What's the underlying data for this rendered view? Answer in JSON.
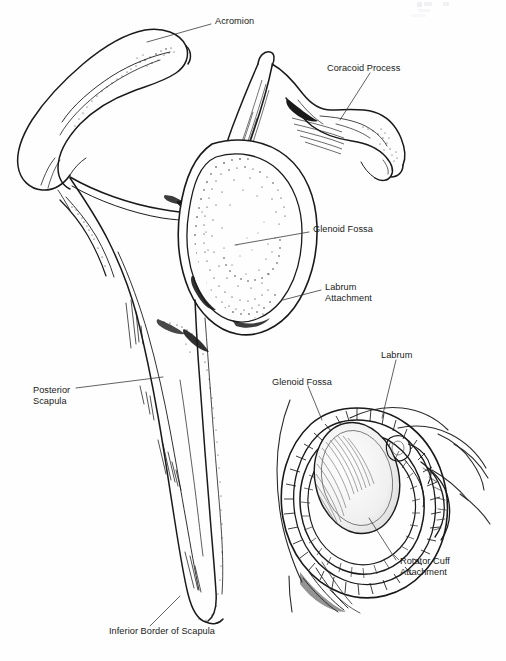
{
  "figure": {
    "type": "anatomical-line-drawing",
    "background_color": "#fefefe",
    "ink_color": "#1a1a1a",
    "text_color": "#1a1a1a",
    "width": 506,
    "height": 661
  },
  "main_view": {
    "name": "Lateral view of scapula",
    "labels": [
      {
        "key": "acromion",
        "text": "Acromion",
        "x": 215,
        "y": 21,
        "lines": 1
      },
      {
        "key": "coracoid_process",
        "text": "Coracoid Process",
        "x": 327,
        "y": 68,
        "lines": 1
      },
      {
        "key": "glenoid_fossa",
        "text": "Glenoid Fossa",
        "x": 313,
        "y": 229,
        "lines": 1
      },
      {
        "key": "labrum_attachment_line1",
        "text": "Labrum",
        "x": 325,
        "y": 287,
        "lines": 2
      },
      {
        "key": "labrum_attachment_line2",
        "text": "Attachment",
        "x": 325,
        "y": 298,
        "lines": 2
      },
      {
        "key": "posterior_scapula_line1",
        "text": "Posterior",
        "x": 33,
        "y": 390,
        "lines": 2
      },
      {
        "key": "posterior_scapula_line2",
        "text": "Scapula",
        "x": 33,
        "y": 401,
        "lines": 2
      },
      {
        "key": "inferior_border",
        "text": "Inferior Border of Scapula",
        "x": 109,
        "y": 631,
        "lines": 1
      }
    ]
  },
  "inset_view": {
    "name": "Glenoid cavity with labrum and rotator cuff",
    "labels": [
      {
        "key": "inset_labrum",
        "text": "Labrum",
        "x": 381,
        "y": 355,
        "lines": 1
      },
      {
        "key": "inset_glenoid_fossa",
        "text": "Glenoid Fossa",
        "x": 272,
        "y": 382,
        "lines": 1
      },
      {
        "key": "rotator_cuff_line1",
        "text": "Rotator Cuff",
        "x": 400,
        "y": 561,
        "lines": 2
      },
      {
        "key": "rotator_cuff_line2",
        "text": "Attachment",
        "x": 400,
        "y": 572,
        "lines": 2
      }
    ]
  },
  "leader_lines": [
    {
      "key": "acromion-leader",
      "from": [
        211,
        24
      ],
      "to": [
        147,
        42
      ]
    },
    {
      "key": "coracoid-leader",
      "from": [
        370,
        73
      ],
      "to": [
        340,
        120
      ]
    },
    {
      "key": "glenoid-fossa-leader",
      "from": [
        309,
        232
      ],
      "to": [
        235,
        245
      ]
    },
    {
      "key": "labrum-attachment-leader",
      "from": [
        321,
        290
      ],
      "to": [
        283,
        300
      ]
    },
    {
      "key": "posterior-scapula-leader",
      "from": [
        76,
        388
      ],
      "to": [
        163,
        377
      ]
    },
    {
      "key": "inferior-border-leader",
      "from": [
        150,
        626
      ],
      "to": [
        180,
        596
      ]
    },
    {
      "key": "inset-labrum-leader",
      "from": [
        396,
        360
      ],
      "to": [
        382,
        418
      ]
    },
    {
      "key": "inset-glenoid-leader",
      "from": [
        308,
        386
      ],
      "to": [
        322,
        420
      ]
    },
    {
      "key": "rotator-cuff-leader",
      "from": [
        396,
        560
      ],
      "to": [
        369,
        518
      ]
    }
  ],
  "structures": [
    {
      "key": "clavicle-acromion",
      "description": "Acromion process and acromial arch, upper left"
    },
    {
      "key": "coracoid",
      "description": "Hook-shaped coracoid process, upper right"
    },
    {
      "key": "glenoid-fossa-oval",
      "description": "Stippled oval glenoid fossa, center"
    },
    {
      "key": "scapular-blade",
      "description": "Long tapering posterior scapular body, lower left"
    },
    {
      "key": "inset-humeral-head",
      "description": "Cross-section of glenoid with labrum ring and rotator cuff"
    }
  ],
  "artifacts": [
    {
      "key": "scan-mark-1",
      "x": 417,
      "y": 2,
      "w": 5,
      "h": 5,
      "color": "#eeeef2"
    },
    {
      "key": "scan-mark-2",
      "x": 424,
      "y": 2,
      "w": 8,
      "h": 4,
      "color": "#f1f1f4"
    },
    {
      "key": "scan-mark-3",
      "x": 443,
      "y": 2,
      "w": 6,
      "h": 4,
      "color": "#f1f1f4"
    },
    {
      "key": "scan-mark-4",
      "x": 418,
      "y": 9,
      "w": 12,
      "h": 3,
      "color": "#f6f6f8"
    },
    {
      "key": "scan-mark-5",
      "x": 412,
      "y": 14,
      "w": 14,
      "h": 3,
      "color": "#f8f8fa"
    }
  ]
}
